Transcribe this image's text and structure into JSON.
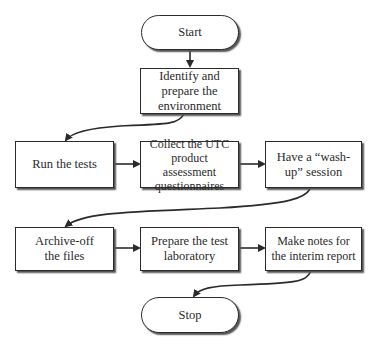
{
  "diagram": {
    "type": "flowchart",
    "nodes": [
      {
        "id": "start",
        "shape": "terminator",
        "label": "Start"
      },
      {
        "id": "identify",
        "shape": "process",
        "label": "Identify and prepare the environment"
      },
      {
        "id": "run",
        "shape": "process",
        "label": "Run the tests"
      },
      {
        "id": "collect",
        "shape": "process",
        "label": "Collect the UTC product assessment questionnaires"
      },
      {
        "id": "washup",
        "shape": "process",
        "label": "Have a “wash-up” session"
      },
      {
        "id": "archive",
        "shape": "process",
        "label": "Archive-off the files"
      },
      {
        "id": "prepare",
        "shape": "process",
        "label": "Prepare the test laboratory"
      },
      {
        "id": "notes",
        "shape": "process",
        "label": "Make notes for the interim report"
      },
      {
        "id": "stop",
        "shape": "terminator",
        "label": "Stop"
      }
    ],
    "edges": [
      {
        "from": "start",
        "to": "identify"
      },
      {
        "from": "identify",
        "to": "run"
      },
      {
        "from": "run",
        "to": "collect"
      },
      {
        "from": "collect",
        "to": "washup"
      },
      {
        "from": "washup",
        "to": "archive"
      },
      {
        "from": "archive",
        "to": "prepare"
      },
      {
        "from": "prepare",
        "to": "notes"
      },
      {
        "from": "notes",
        "to": "stop"
      }
    ]
  }
}
